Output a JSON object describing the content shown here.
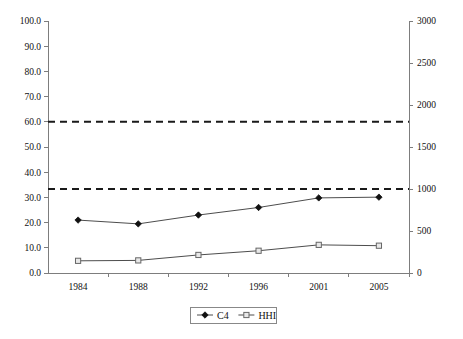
{
  "chart_data": {
    "type": "line",
    "title": "",
    "xlabel": "",
    "ylabel": "",
    "categories": [
      "1984",
      "1988",
      "1992",
      "1996",
      "2001",
      "2005"
    ],
    "series": [
      {
        "name": "C4",
        "axis": "left",
        "marker": "filled-diamond",
        "values": [
          21.0,
          19.5,
          23.0,
          26.0,
          29.8,
          30.1
        ]
      },
      {
        "name": "HHI",
        "axis": "right",
        "marker": "open-square",
        "values": [
          145,
          150,
          215,
          265,
          335,
          325
        ]
      }
    ],
    "reference_lines": [
      {
        "name": "hhi-1800-threshold",
        "axis": "right",
        "value": 1800,
        "style": "dashed"
      },
      {
        "name": "hhi-1000-threshold",
        "axis": "right",
        "value": 1000,
        "style": "dashed"
      }
    ],
    "left_axis": {
      "min": 0.0,
      "max": 100.0,
      "step": 10.0,
      "ticks": [
        "0.0",
        "10.0",
        "20.0",
        "30.0",
        "40.0",
        "50.0",
        "60.0",
        "70.0",
        "80.0",
        "90.0",
        "100.0"
      ]
    },
    "right_axis": {
      "min": 0,
      "max": 3000,
      "step": 500,
      "ticks": [
        "0",
        "500",
        "1000",
        "1500",
        "2000",
        "2500",
        "3000"
      ]
    },
    "grid": false,
    "legend_position": "bottom",
    "legend": [
      {
        "label": "C4",
        "marker": "filled-diamond"
      },
      {
        "label": "HHI",
        "marker": "open-square"
      }
    ],
    "colors": {
      "series_line": "#4d4d4d",
      "reference_line": "#1a1a1a",
      "axis": "#7d7d7d",
      "background": "#ffffff"
    }
  }
}
